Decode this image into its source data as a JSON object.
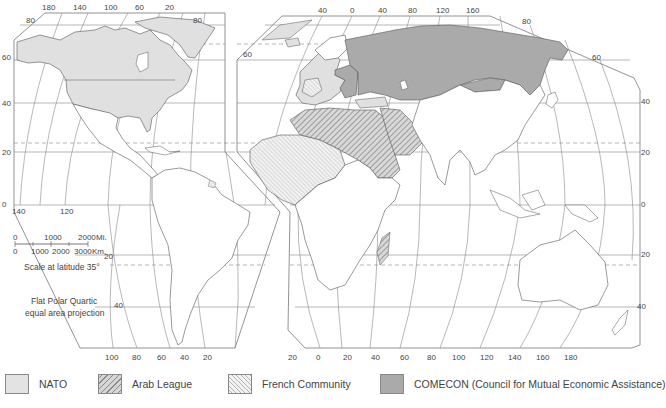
{
  "map": {
    "projection_note": [
      "Flat Polar Quartic",
      "equal area projection"
    ],
    "scale": {
      "miles_ticks": [
        "0",
        "1000",
        "2000"
      ],
      "miles_unit": "Mi.",
      "km_ticks": [
        "0",
        "1000",
        "2000",
        "3000"
      ],
      "km_unit": "Km.",
      "caption": "Scale at latitude 35°"
    },
    "left_panel": {
      "top_longitudes": [
        "180",
        "140",
        "100",
        "60",
        "20"
      ],
      "bottom_longitudes": [
        "100",
        "80",
        "60",
        "40",
        "20"
      ],
      "latitudes": [
        "80",
        "60",
        "40",
        "20",
        "0",
        "20",
        "40"
      ],
      "corner_longitudes": [
        "140",
        "120"
      ]
    },
    "right_panel": {
      "top_longitudes": [
        "40",
        "0",
        "40",
        "80",
        "120",
        "160"
      ],
      "bottom_longitudes": [
        "20",
        "0",
        "20",
        "40",
        "60",
        "80",
        "100",
        "120",
        "140",
        "160",
        "180"
      ],
      "latitudes_left": [
        "60",
        "40",
        "20",
        "0",
        "20",
        "40"
      ],
      "latitudes_right": [
        "80",
        "60",
        "40",
        "20",
        "0",
        "20",
        "40"
      ]
    }
  },
  "legend": {
    "items": [
      {
        "label": "NATO",
        "pattern": "light-gray-fill",
        "color": "#e3e3e3"
      },
      {
        "label": "Arab League",
        "pattern": "dense-diagonal-hatch",
        "color": "#8a8a8a"
      },
      {
        "label": "French Community",
        "pattern": "light-diagonal-hatch",
        "color": "#b4b4b4"
      },
      {
        "label": "COMECON (Council for Mutual Economic Assistance)",
        "pattern": "dark-gray-fill",
        "color": "#aaaaaa"
      }
    ]
  }
}
